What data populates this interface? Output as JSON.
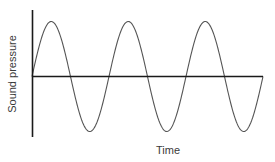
{
  "chart_data": {
    "type": "line",
    "title": "",
    "xlabel": "Time",
    "ylabel": "Sound pressure",
    "grid": false,
    "legend": null,
    "cycles": 3,
    "x": [
      0,
      0.25,
      0.5,
      0.75,
      1,
      1.25,
      1.5,
      1.75,
      2,
      2.25,
      2.5,
      2.75,
      3
    ],
    "series": [
      {
        "name": "Sound pressure",
        "values": [
          0,
          1,
          0,
          -1,
          0,
          1,
          0,
          -1,
          0,
          1,
          0,
          -1,
          0
        ]
      }
    ],
    "xlim": [
      0,
      3
    ],
    "ylim": [
      -1.1,
      1.1
    ],
    "colors": {
      "wave": "#555555",
      "axes": "#1a1a1a",
      "text": "#3a3a3a"
    }
  },
  "labels": {
    "x_axis": "Time",
    "y_axis": "Sound pressure"
  }
}
